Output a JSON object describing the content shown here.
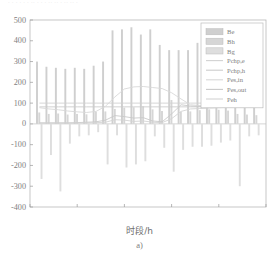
{
  "figure": {
    "top_fragment": "· · ·   · ·  · ·· ·  · · ·· ·· · ·· ·· ·",
    "caption": "a)",
    "xlabel": "时段/h"
  },
  "legend": {
    "position": "top-right",
    "items": [
      {
        "label": "Be",
        "kind": "bar",
        "color": "#cfcfcf"
      },
      {
        "label": "Bh",
        "kind": "bar",
        "color": "#d6d6d6"
      },
      {
        "label": "Bg",
        "kind": "bar",
        "color": "#dedede"
      },
      {
        "label": "Pchp,e",
        "kind": "line",
        "color": "#d2d2d2"
      },
      {
        "label": "Pchp,h",
        "kind": "line",
        "color": "#cccccc"
      },
      {
        "label": "Pes,in",
        "kind": "line",
        "color": "#d8d8d8"
      },
      {
        "label": "Pes,out",
        "kind": "line",
        "color": "#c9c9c9"
      },
      {
        "label": "Peh",
        "kind": "line",
        "color": "#d4d4d4"
      }
    ]
  },
  "axes": {
    "x_ticks": [
      0,
      5,
      10,
      15,
      20,
      25
    ],
    "y_ticks": [
      -400,
      -300,
      -200,
      -100,
      0,
      100,
      200,
      300,
      400,
      500
    ],
    "xlim": [
      0,
      25
    ],
    "ylim": [
      -400,
      500
    ],
    "grid": false
  },
  "chart_data": {
    "type": "bar",
    "title": "",
    "subtitle": "",
    "xlabel": "时段/h",
    "ylabel": "",
    "xlim": [
      0,
      25
    ],
    "ylim": [
      -400,
      500
    ],
    "grid": false,
    "legend_position": "top-right",
    "categories": [
      1,
      2,
      3,
      4,
      5,
      6,
      7,
      8,
      9,
      10,
      11,
      12,
      13,
      14,
      15,
      16,
      17,
      18,
      19,
      20,
      21,
      22,
      23,
      24
    ],
    "x": [
      1,
      2,
      3,
      4,
      5,
      6,
      7,
      8,
      9,
      10,
      11,
      12,
      13,
      14,
      15,
      16,
      17,
      18,
      19,
      20,
      21,
      22,
      23,
      24
    ],
    "series": [
      {
        "name": "Be",
        "type": "bar",
        "color": "#cfcfcf",
        "values": [
          300,
          275,
          270,
          265,
          270,
          265,
          280,
          300,
          450,
          455,
          465,
          430,
          455,
          380,
          355,
          355,
          355,
          390,
          355,
          355,
          315,
          95,
          92,
          90
        ]
      },
      {
        "name": "Bh",
        "type": "bar",
        "color": "#d6d6d6",
        "values": [
          55,
          48,
          50,
          45,
          48,
          46,
          58,
          60,
          72,
          78,
          80,
          85,
          70,
          62,
          115,
          58,
          60,
          66,
          70,
          68,
          64,
          48,
          45,
          42
        ]
      },
      {
        "name": "Bg",
        "type": "bar",
        "color": "#dedede",
        "values": [
          -265,
          -150,
          -325,
          -95,
          -60,
          -55,
          -40,
          -195,
          -55,
          -210,
          -195,
          -180,
          -60,
          -115,
          -230,
          -125,
          -110,
          -110,
          -105,
          -90,
          -80,
          -300,
          -60,
          -55
        ]
      },
      {
        "name": "Pchp,e",
        "type": "line",
        "color": "#d2d2d2",
        "values": [
          100,
          100,
          100,
          100,
          100,
          100,
          100,
          100,
          100,
          100,
          100,
          100,
          100,
          100,
          100,
          100,
          100,
          100,
          100,
          100,
          100,
          100,
          100,
          100
        ]
      },
      {
        "name": "Pchp,h",
        "type": "line",
        "color": "#cccccc",
        "values": [
          82,
          82,
          82,
          82,
          82,
          82,
          82,
          82,
          82,
          82,
          82,
          82,
          82,
          82,
          82,
          82,
          82,
          82,
          82,
          82,
          82,
          82,
          82,
          82
        ]
      },
      {
        "name": "Pes,in",
        "type": "line",
        "color": "#d8d8d8",
        "values": [
          78,
          72,
          68,
          62,
          58,
          55,
          60,
          85,
          130,
          168,
          178,
          180,
          175,
          170,
          150,
          120,
          92,
          88,
          85,
          88,
          90,
          90,
          88,
          86
        ]
      },
      {
        "name": "Pes,out",
        "type": "line",
        "color": "#c9c9c9",
        "values": [
          5,
          5,
          5,
          5,
          6,
          8,
          10,
          18,
          40,
          35,
          28,
          30,
          14,
          10,
          48,
          92,
          86,
          84,
          84,
          86,
          88,
          88,
          88,
          86
        ]
      },
      {
        "name": "Peh",
        "type": "line",
        "color": "#d4d4d4",
        "values": [
          4,
          4,
          4,
          4,
          4,
          5,
          6,
          8,
          20,
          18,
          12,
          14,
          8,
          6,
          25,
          60,
          72,
          74,
          76,
          78,
          80,
          82,
          82,
          82
        ]
      }
    ]
  }
}
